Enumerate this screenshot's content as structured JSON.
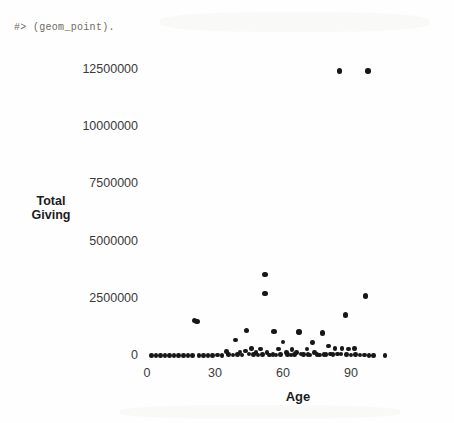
{
  "console": {
    "text": "#> (geom_point)."
  },
  "chart_data": {
    "type": "scatter",
    "title": "",
    "xlabel": "Age",
    "ylabel": "Total Giving",
    "xlim": [
      0,
      105
    ],
    "ylim": [
      0,
      13300000
    ],
    "grid": false,
    "legend": null,
    "xticks": [
      0,
      30,
      60,
      90
    ],
    "xtick_labels": [
      "0",
      "30",
      "60",
      "90"
    ],
    "yticks": [
      0,
      2500000,
      5000000,
      7500000,
      10000000,
      12500000
    ],
    "ytick_labels": [
      "0",
      "2500000",
      "5000000",
      "7500000",
      "10000000",
      "12500000"
    ],
    "point_color": "#171717",
    "points": [
      {
        "x": 85.0,
        "y": 12450000
      },
      {
        "x": 97.5,
        "y": 12450000
      },
      {
        "x": 52.0,
        "y": 3550000
      },
      {
        "x": 52.0,
        "y": 2720000
      },
      {
        "x": 96.5,
        "y": 2620000
      },
      {
        "x": 87.5,
        "y": 1800000
      },
      {
        "x": 21.0,
        "y": 1560000
      },
      {
        "x": 22.0,
        "y": 1500000
      },
      {
        "x": 44.0,
        "y": 1120000
      },
      {
        "x": 56.0,
        "y": 1080000
      },
      {
        "x": 67.0,
        "y": 1050000
      },
      {
        "x": 77.5,
        "y": 1010000
      },
      {
        "x": 39.0,
        "y": 700000
      },
      {
        "x": 60.0,
        "y": 620000
      },
      {
        "x": 73.0,
        "y": 600000
      },
      {
        "x": 80.0,
        "y": 430000
      },
      {
        "x": 46.0,
        "y": 330000
      },
      {
        "x": 50.0,
        "y": 310000
      },
      {
        "x": 58.0,
        "y": 300000
      },
      {
        "x": 64.0,
        "y": 280000
      },
      {
        "x": 70.5,
        "y": 300000
      },
      {
        "x": 83.0,
        "y": 330000
      },
      {
        "x": 86.0,
        "y": 320000
      },
      {
        "x": 89.0,
        "y": 300000
      },
      {
        "x": 91.5,
        "y": 330000
      },
      {
        "x": 35.0,
        "y": 200000
      },
      {
        "x": 41.0,
        "y": 180000
      },
      {
        "x": 43.5,
        "y": 210000
      },
      {
        "x": 48.0,
        "y": 160000
      },
      {
        "x": 53.0,
        "y": 150000
      },
      {
        "x": 61.5,
        "y": 160000
      },
      {
        "x": 66.0,
        "y": 140000
      },
      {
        "x": 74.0,
        "y": 160000
      },
      {
        "x": 2.0,
        "y": 30000
      },
      {
        "x": 4.0,
        "y": 20000
      },
      {
        "x": 6.0,
        "y": 25000
      },
      {
        "x": 8.0,
        "y": 20000
      },
      {
        "x": 10.0,
        "y": 30000
      },
      {
        "x": 12.0,
        "y": 20000
      },
      {
        "x": 14.0,
        "y": 25000
      },
      {
        "x": 16.0,
        "y": 20000
      },
      {
        "x": 18.0,
        "y": 30000
      },
      {
        "x": 20.0,
        "y": 25000
      },
      {
        "x": 23.0,
        "y": 20000
      },
      {
        "x": 25.0,
        "y": 30000
      },
      {
        "x": 27.0,
        "y": 25000
      },
      {
        "x": 29.0,
        "y": 20000
      },
      {
        "x": 31.0,
        "y": 35000
      },
      {
        "x": 33.0,
        "y": 25000
      },
      {
        "x": 36.0,
        "y": 60000
      },
      {
        "x": 38.0,
        "y": 40000
      },
      {
        "x": 40.0,
        "y": 70000
      },
      {
        "x": 42.0,
        "y": 50000
      },
      {
        "x": 45.0,
        "y": 80000
      },
      {
        "x": 47.0,
        "y": 60000
      },
      {
        "x": 49.0,
        "y": 45000
      },
      {
        "x": 51.0,
        "y": 70000
      },
      {
        "x": 54.0,
        "y": 40000
      },
      {
        "x": 55.5,
        "y": 60000
      },
      {
        "x": 57.0,
        "y": 45000
      },
      {
        "x": 59.0,
        "y": 55000
      },
      {
        "x": 62.0,
        "y": 70000
      },
      {
        "x": 63.5,
        "y": 50000
      },
      {
        "x": 65.0,
        "y": 60000
      },
      {
        "x": 68.0,
        "y": 80000
      },
      {
        "x": 69.0,
        "y": 55000
      },
      {
        "x": 71.0,
        "y": 70000
      },
      {
        "x": 72.0,
        "y": 50000
      },
      {
        "x": 75.0,
        "y": 60000
      },
      {
        "x": 76.0,
        "y": 45000
      },
      {
        "x": 78.0,
        "y": 75000
      },
      {
        "x": 79.0,
        "y": 55000
      },
      {
        "x": 81.0,
        "y": 90000
      },
      {
        "x": 82.0,
        "y": 70000
      },
      {
        "x": 84.0,
        "y": 95000
      },
      {
        "x": 85.5,
        "y": 80000
      },
      {
        "x": 88.0,
        "y": 60000
      },
      {
        "x": 90.0,
        "y": 45000
      },
      {
        "x": 92.0,
        "y": 55000
      },
      {
        "x": 94.0,
        "y": 40000
      },
      {
        "x": 96.0,
        "y": 35000
      },
      {
        "x": 98.0,
        "y": 30000
      },
      {
        "x": 100.0,
        "y": 25000
      },
      {
        "x": 105.0,
        "y": 25000
      }
    ]
  }
}
